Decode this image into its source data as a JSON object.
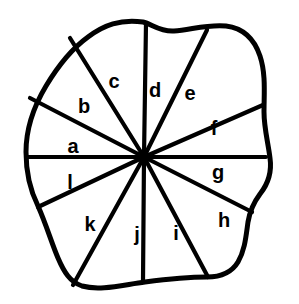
{
  "figure": {
    "colors": {
      "stroke": "#000000",
      "background": "#ffffff",
      "fill": "#ffffff"
    },
    "hub": {
      "x": 144,
      "y": 157
    },
    "outline_path": "M 143 22 C 120 19 104 25 88 37 C 70 50 58 66 46 86 C 34 106 26 128 26 152 C 26 172 30 190 38 206 C 46 224 52 244 58 258 C 64 272 70 282 82 286 C 100 291 122 285 145 282 C 168 279 190 277 207 277 C 222 277 232 272 238 262 C 245 250 246 236 248 222 C 250 210 254 202 260 194 C 268 184 272 172 270 158 C 268 142 264 128 264 112 C 264 94 266 74 260 56 C 254 38 242 28 226 26 C 208 24 190 30 174 31 C 160 32 152 24 143 22 Z",
    "labels": [
      {
        "id": "a",
        "text": "a",
        "x": 73,
        "y": 148
      },
      {
        "id": "b",
        "text": "b",
        "x": 84,
        "y": 108
      },
      {
        "id": "c",
        "text": "c",
        "x": 114,
        "y": 83
      },
      {
        "id": "d",
        "text": "d",
        "x": 155,
        "y": 92
      },
      {
        "id": "e",
        "text": "e",
        "x": 190,
        "y": 95
      },
      {
        "id": "f",
        "text": "f",
        "x": 214,
        "y": 130
      },
      {
        "id": "g",
        "text": "g",
        "x": 218,
        "y": 174
      },
      {
        "id": "h",
        "text": "h",
        "x": 224,
        "y": 222
      },
      {
        "id": "i",
        "text": "i",
        "x": 176,
        "y": 235
      },
      {
        "id": "j",
        "text": "j",
        "x": 137,
        "y": 236
      },
      {
        "id": "k",
        "text": "k",
        "x": 90,
        "y": 226
      },
      {
        "id": "l",
        "text": "l",
        "x": 70,
        "y": 184
      }
    ],
    "spokes": [
      {
        "id": "spoke-a-b",
        "from_label": "a",
        "to_label": "b",
        "x1": 144,
        "y1": 157,
        "x2": 30,
        "y2": 98
      },
      {
        "id": "spoke-b-c",
        "from_label": "b",
        "to_label": "c",
        "x1": 144,
        "y1": 157,
        "x2": 70,
        "y2": 38
      },
      {
        "id": "spoke-c-d",
        "from_label": "c",
        "to_label": "d",
        "x1": 144,
        "y1": 157,
        "x2": 146,
        "y2": 23
      },
      {
        "id": "spoke-d-e",
        "from_label": "d",
        "to_label": "e",
        "x1": 144,
        "y1": 157,
        "x2": 207,
        "y2": 30
      },
      {
        "id": "spoke-e-f",
        "from_label": "e",
        "to_label": "f",
        "x1": 144,
        "y1": 157,
        "x2": 263,
        "y2": 105
      },
      {
        "id": "spoke-f-g",
        "from_label": "f",
        "to_label": "g",
        "x1": 144,
        "y1": 157,
        "x2": 266,
        "y2": 157
      },
      {
        "id": "spoke-g-h",
        "from_label": "g",
        "to_label": "h",
        "x1": 144,
        "y1": 157,
        "x2": 252,
        "y2": 212
      },
      {
        "id": "spoke-h-i",
        "from_label": "h",
        "to_label": "i",
        "x1": 144,
        "y1": 157,
        "x2": 208,
        "y2": 277
      },
      {
        "id": "spoke-i-j",
        "from_label": "i",
        "to_label": "j",
        "x1": 144,
        "y1": 157,
        "x2": 143,
        "y2": 281
      },
      {
        "id": "spoke-j-k",
        "from_label": "j",
        "to_label": "k",
        "x1": 144,
        "y1": 157,
        "x2": 73,
        "y2": 285
      },
      {
        "id": "spoke-k-l",
        "from_label": "k",
        "to_label": "l",
        "x1": 144,
        "y1": 157,
        "x2": 38,
        "y2": 207
      },
      {
        "id": "spoke-l-a",
        "from_label": "l",
        "to_label": "a",
        "x1": 144,
        "y1": 157,
        "x2": 26,
        "y2": 157
      }
    ],
    "sector_count": "12"
  }
}
